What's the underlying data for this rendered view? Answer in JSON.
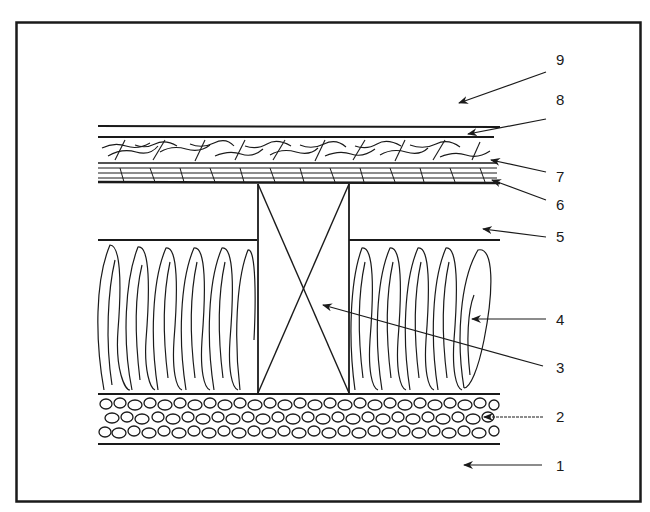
{
  "diagram": {
    "type": "cross-section",
    "labels": [
      {
        "id": "1",
        "text": "1",
        "x": 563,
        "y": 472
      },
      {
        "id": "2",
        "text": "2",
        "x": 563,
        "y": 414
      },
      {
        "id": "3",
        "text": "3",
        "x": 563,
        "y": 372
      },
      {
        "id": "4",
        "text": "4",
        "x": 563,
        "y": 326
      },
      {
        "id": "5",
        "text": "5",
        "x": 563,
        "y": 243
      },
      {
        "id": "6",
        "text": "6",
        "x": 563,
        "y": 209
      },
      {
        "id": "7",
        "text": "7",
        "x": 563,
        "y": 177
      },
      {
        "id": "8",
        "text": "8",
        "x": 563,
        "y": 128
      },
      {
        "id": "9",
        "text": "9",
        "x": 563,
        "y": 80
      }
    ],
    "layers": [
      {
        "label": "9",
        "region": "space above floor"
      },
      {
        "label": "8",
        "region": "top floor surface line"
      },
      {
        "label": "7",
        "region": "upper wood board layer"
      },
      {
        "label": "6",
        "region": "lower wood board layer"
      },
      {
        "label": "5",
        "region": "air gap above insulation"
      },
      {
        "label": "4",
        "region": "fibrous insulation"
      },
      {
        "label": "3",
        "region": "timber joist (cross-braced)"
      },
      {
        "label": "2",
        "region": "gravel / pebble layer"
      },
      {
        "label": "1",
        "region": "ground below"
      }
    ],
    "colors": {
      "ink": "#1a1a1a",
      "background": "#ffffff"
    }
  }
}
